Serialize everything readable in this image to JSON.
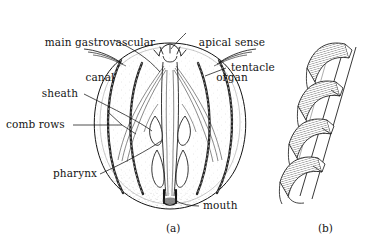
{
  "figure": {
    "background_color": "#ffffff",
    "ink_color": "#141414",
    "stipple_color": "#8a8a8a",
    "comb_row_color": "#2b2b2b"
  },
  "labels": {
    "gastrovascular_canal_line1": "main gastrovascular",
    "gastrovascular_canal_line2": "canal",
    "apical_sense_organ_line1": "apical sense",
    "apical_sense_organ_line2": "organ",
    "tentacle": "tentacle",
    "sheath": "sheath",
    "comb_rows": "comb rows",
    "pharynx": "pharynx",
    "mouth": "mouth"
  },
  "panels": {
    "a": {
      "caption": "(a)",
      "description": "whole ctenophore body, cutaway view"
    },
    "b": {
      "caption": "(b)",
      "description": "detail of comb plates",
      "plate_count": 4
    }
  },
  "anatomy": {
    "comb_row_count_visible": 4,
    "parts": [
      "main gastrovascular canal",
      "apical sense organ",
      "tentacle",
      "sheath",
      "comb rows",
      "pharynx",
      "mouth"
    ]
  }
}
